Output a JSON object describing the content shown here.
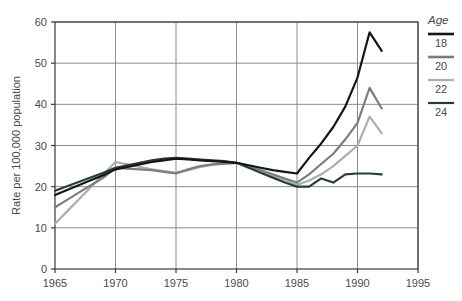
{
  "chart_data": {
    "type": "line",
    "title": "",
    "xlabel": "",
    "ylabel": "Rate per 100,000 population",
    "xlim": [
      1965,
      1995
    ],
    "ylim": [
      0,
      60
    ],
    "xticks": [
      1965,
      1970,
      1975,
      1980,
      1985,
      1990,
      1995
    ],
    "yticks": [
      0,
      10,
      20,
      30,
      40,
      50,
      60
    ],
    "grid": true,
    "legend_position": "right",
    "legend_title": "Age",
    "series": [
      {
        "name": "18",
        "color": "#151515",
        "width": 2.2,
        "x": [
          1965,
          1966,
          1967,
          1968,
          1969,
          1970,
          1971,
          1972,
          1973,
          1974,
          1975,
          1976,
          1977,
          1978,
          1979,
          1980,
          1981,
          1982,
          1983,
          1984,
          1985,
          1986,
          1987,
          1988,
          1989,
          1990,
          1991,
          1992
        ],
        "values": [
          18.0,
          19.2,
          20.4,
          21.6,
          22.8,
          24.2,
          24.8,
          25.4,
          26.0,
          26.4,
          26.8,
          26.6,
          26.4,
          26.2,
          26.0,
          25.8,
          25.2,
          24.6,
          24.0,
          23.6,
          23.2,
          27.0,
          30.5,
          34.5,
          39.5,
          46.5,
          57.5,
          53.0
        ]
      },
      {
        "name": "20",
        "color": "#7d7d7d",
        "width": 2.2,
        "x": [
          1965,
          1966,
          1967,
          1968,
          1969,
          1970,
          1971,
          1972,
          1973,
          1974,
          1975,
          1976,
          1977,
          1978,
          1979,
          1980,
          1981,
          1982,
          1983,
          1984,
          1985,
          1986,
          1987,
          1988,
          1989,
          1990,
          1991,
          1992
        ],
        "values": [
          15.0,
          16.8,
          18.6,
          20.4,
          22.2,
          24.6,
          24.4,
          24.2,
          24.0,
          23.6,
          23.2,
          24.2,
          25.0,
          25.4,
          25.6,
          25.8,
          25.0,
          24.0,
          23.0,
          22.0,
          21.0,
          23.0,
          25.5,
          28.0,
          31.5,
          35.5,
          44.0,
          39.0
        ]
      },
      {
        "name": "22",
        "color": "#adadad",
        "width": 2.2,
        "x": [
          1965,
          1966,
          1967,
          1968,
          1969,
          1970,
          1971,
          1972,
          1973,
          1974,
          1975,
          1976,
          1977,
          1978,
          1979,
          1980,
          1981,
          1982,
          1983,
          1984,
          1985,
          1986,
          1987,
          1988,
          1989,
          1990,
          1991,
          1992
        ],
        "values": [
          11.0,
          14.0,
          17.0,
          20.0,
          23.0,
          26.0,
          25.4,
          24.8,
          24.2,
          23.8,
          23.4,
          24.0,
          24.8,
          25.3,
          25.6,
          25.8,
          25.0,
          24.0,
          22.8,
          21.6,
          20.4,
          21.5,
          23.0,
          25.0,
          27.5,
          30.0,
          37.0,
          33.0
        ]
      },
      {
        "name": "24",
        "color": "#24402f",
        "width": 2.2,
        "x": [
          1965,
          1966,
          1967,
          1968,
          1969,
          1970,
          1971,
          1972,
          1973,
          1974,
          1975,
          1976,
          1977,
          1978,
          1979,
          1980,
          1981,
          1982,
          1983,
          1984,
          1985,
          1986,
          1987,
          1988,
          1989,
          1990,
          1991,
          1992
        ],
        "values": [
          19.0,
          20.1,
          21.2,
          22.3,
          23.4,
          24.6,
          25.2,
          25.8,
          26.4,
          26.8,
          27.0,
          26.8,
          26.6,
          26.4,
          26.2,
          25.8,
          24.6,
          23.4,
          22.2,
          21.0,
          20.0,
          20.0,
          22.0,
          21.0,
          23.0,
          23.2,
          23.2,
          23.0
        ]
      }
    ],
    "legend_entries": [
      {
        "label": "18",
        "color": "#151515",
        "swatch_width": 2.6
      },
      {
        "label": "20",
        "color": "#7d7d7d",
        "swatch_width": 2.6
      },
      {
        "label": "22",
        "color": "#adadad",
        "swatch_width": 2.2
      },
      {
        "label": "24",
        "color": "#24402f",
        "swatch_width": 2.2
      }
    ]
  },
  "axes": {
    "y_axis_title": "Rate per 100,000 population",
    "y_tick_labels": [
      "60",
      "50",
      "40",
      "30",
      "20",
      "10",
      "0"
    ],
    "x_tick_labels": [
      "1965",
      "1970",
      "1975",
      "1980",
      "1985",
      "1990",
      "1995"
    ]
  },
  "legend": {
    "title": "Age",
    "items": [
      "18",
      "20",
      "22",
      "24"
    ]
  },
  "colors": {
    "axis": "#3a3a3a",
    "grid": "#8c8c8c",
    "background": "#ffffff",
    "series_18": "#151515",
    "series_20": "#7d7d7d",
    "series_22": "#adadad",
    "series_24": "#24402f"
  }
}
